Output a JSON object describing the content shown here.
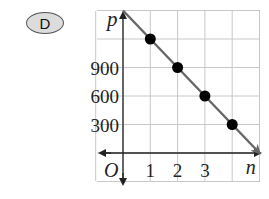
{
  "choice": {
    "label": "D"
  },
  "axes": {
    "x_label": "n",
    "y_label": "p",
    "origin_label": "O"
  },
  "chart_data": {
    "type": "line",
    "title": "",
    "xlabel": "n",
    "ylabel": "p",
    "x_ticks": [
      "1",
      "2",
      "3"
    ],
    "y_ticks": [
      "300",
      "600",
      "900"
    ],
    "xlim": [
      -1,
      5
    ],
    "ylim": [
      -300,
      1500
    ],
    "grid": true,
    "legend": "none",
    "series": [
      {
        "name": "points",
        "x": [
          1,
          2,
          3,
          4
        ],
        "y": [
          1200,
          900,
          600,
          300
        ],
        "marker": "filled-circle"
      },
      {
        "name": "line",
        "x": [
          0,
          5
        ],
        "y": [
          1500,
          0
        ],
        "style": "arrow-end"
      }
    ],
    "colors": {
      "line": "#666666",
      "points": "#000000",
      "grid": "#c8c8c8",
      "axes": "#222222"
    }
  }
}
